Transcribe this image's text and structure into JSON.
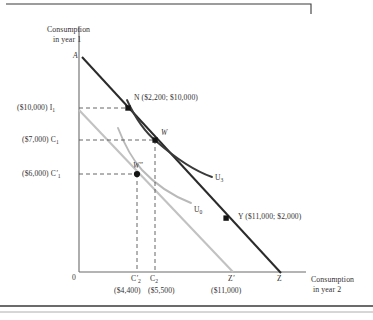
{
  "figure": {
    "type": "economics-indifference-curve-diagram",
    "axes": {
      "y_title_line1": "Consumption",
      "y_title_line2": "in year 1",
      "x_title_line1": "Consumption",
      "x_title_line2": "in year 2",
      "origin_label": "0"
    },
    "y_ticks": [
      {
        "id": "I1",
        "money": "($10,000)",
        "symbol": "I",
        "sub": "1",
        "prime": ""
      },
      {
        "id": "C1",
        "money": "($7,000)",
        "symbol": "C",
        "sub": "1",
        "prime": ""
      },
      {
        "id": "C1p",
        "money": "($6,000)",
        "symbol": "C",
        "sub": "1",
        "prime": "′"
      }
    ],
    "x_ticks": [
      {
        "id": "C2p",
        "symbol": "C",
        "sub": "2",
        "prime": "′",
        "money": "($4,400)"
      },
      {
        "id": "C2",
        "symbol": "C",
        "sub": "2",
        "prime": "",
        "money": "($5,500)"
      },
      {
        "id": "Zp",
        "symbol": "Z",
        "sub": "",
        "prime": "′",
        "money": "($11,000)"
      },
      {
        "id": "Z",
        "symbol": "Z",
        "sub": "",
        "prime": "",
        "money": ""
      }
    ],
    "points": [
      {
        "id": "A",
        "label": "A",
        "annotation": ""
      },
      {
        "id": "N",
        "label": "N",
        "annotation": "($2,200; $10,000)"
      },
      {
        "id": "W",
        "label": "W",
        "annotation": ""
      },
      {
        "id": "Wpp",
        "label": "W″",
        "annotation": ""
      },
      {
        "id": "Y",
        "label": "Y",
        "annotation": "($11,000; $2,000)"
      }
    ],
    "curves": [
      {
        "id": "U3",
        "label": "U",
        "sub": "3",
        "color": "#3a3a3a"
      },
      {
        "id": "U0",
        "label": "U",
        "sub": "0",
        "color": "#b4b4b4"
      }
    ],
    "colors": {
      "budget_dark": "#2b2b2b",
      "budget_light": "#c2c2c2",
      "curve_dark": "#3a3a3a",
      "curve_light": "#b9b9b9",
      "axis": "#6b6b6b",
      "dash": "#555555",
      "frame": "#3a3a3a"
    }
  }
}
